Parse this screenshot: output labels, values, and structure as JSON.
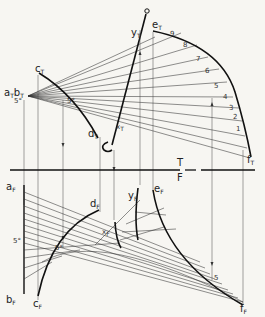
{
  "figure": {
    "type": "descriptive-geometry-construction",
    "background": "#f7f6f2",
    "ink": "#222222",
    "fold_line": {
      "label_top": "T",
      "label_bottom": "F"
    },
    "top_view_labels": {
      "ab": "a",
      "ab_sub": "T",
      "b": "b",
      "b_sub": "T",
      "c": "c",
      "c_sub": "T",
      "d": "d",
      "d_sub": "T",
      "e": "e",
      "e_sub": "T",
      "f": "f",
      "f_sub": "T",
      "x": "x",
      "x_sub": "T",
      "y": "y",
      "y_sub": "T",
      "angle_a": "5°",
      "angle_c": "5°"
    },
    "front_view_labels": {
      "a": "a",
      "a_sub": "F",
      "b": "b",
      "b_sub": "F",
      "c": "c",
      "c_sub": "F",
      "d": "d",
      "d_sub": "F",
      "e": "e",
      "e_sub": "F",
      "f": "f",
      "f_sub": "F",
      "x": "x",
      "x_sub": "F",
      "y": "y",
      "y_sub": "F",
      "angle_a": "5°",
      "angle_c": "5°",
      "mark_5": "5"
    },
    "curve_division_numbers": [
      "1",
      "2",
      "3",
      "4",
      "5",
      "6",
      "7",
      "8",
      "9"
    ]
  }
}
